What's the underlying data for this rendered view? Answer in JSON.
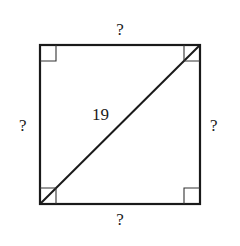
{
  "diagram": {
    "shape": "square",
    "diagonal_label": "19",
    "side_labels": {
      "top": "?",
      "left": "?",
      "right": "?",
      "bottom": "?"
    },
    "right_angle_marks": [
      "top-left",
      "top-right",
      "bottom-left",
      "bottom-right"
    ],
    "stroke_color": "#1a1a1a"
  }
}
